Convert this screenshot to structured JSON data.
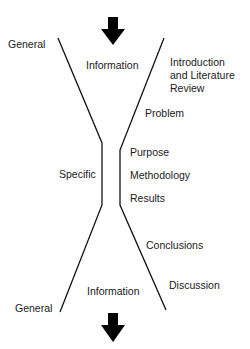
{
  "diagram": {
    "type": "hourglass",
    "top_arrow": {
      "direction": "down"
    },
    "bottom_arrow": {
      "direction": "down"
    },
    "left_labels": {
      "top": "General",
      "middle": "Specific",
      "bottom": "General"
    },
    "center_labels": {
      "top": "Information",
      "bottom": "Information"
    },
    "sections": [
      {
        "label_line1": "Introduction",
        "label_line2": "and Literature",
        "label_line3": "Review"
      },
      {
        "label": "Problem"
      },
      {
        "label": "Purpose"
      },
      {
        "label": "Methodology"
      },
      {
        "label": "Results"
      },
      {
        "label": "Conclusions"
      },
      {
        "label": "Discussion"
      }
    ],
    "colors": {
      "line": "#111111",
      "arrow": "#000000",
      "text": "#1a1a1a"
    }
  }
}
